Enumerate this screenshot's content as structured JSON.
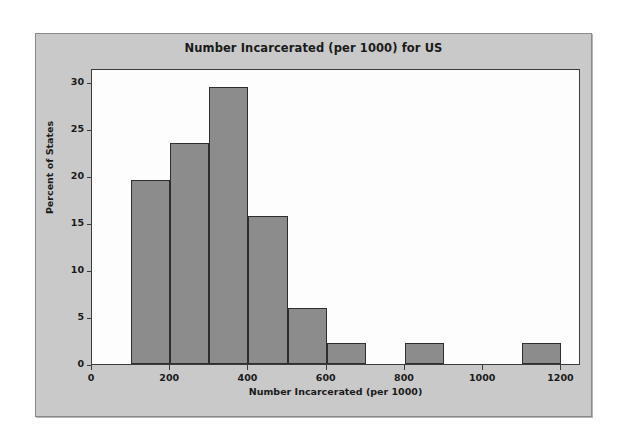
{
  "figure": {
    "background_color": "#c9c9c9",
    "plot_background_color": "#fdfdfd",
    "bar_fill_color": "#8c8c8c",
    "bar_edge_color": "#2e2e2e"
  },
  "chart_data": {
    "type": "bar",
    "title": "Number Incarcerated (per 1000) for US",
    "xlabel": "Number Incarcerated (per 1000)",
    "ylabel": "Percent of States",
    "grid": false,
    "legend": null,
    "xlim": [
      0,
      1250
    ],
    "ylim": [
      0,
      31.5
    ],
    "xticks": [
      0,
      200,
      400,
      600,
      800,
      1000,
      1200
    ],
    "xtick_labels": [
      "0",
      "200",
      "400",
      "600",
      "800",
      "1000",
      "1200"
    ],
    "yticks": [
      0,
      5,
      10,
      15,
      20,
      25,
      30
    ],
    "ytick_labels": [
      "0",
      "5",
      "10",
      "15",
      "20",
      "25",
      "30"
    ],
    "bin_width": 100,
    "bins": [
      {
        "left": 100,
        "right": 200,
        "value": 19.6
      },
      {
        "left": 200,
        "right": 300,
        "value": 23.5
      },
      {
        "left": 300,
        "right": 400,
        "value": 29.5
      },
      {
        "left": 400,
        "right": 500,
        "value": 15.8
      },
      {
        "left": 500,
        "right": 600,
        "value": 6.0
      },
      {
        "left": 600,
        "right": 700,
        "value": 2.2
      },
      {
        "left": 800,
        "right": 900,
        "value": 2.2
      },
      {
        "left": 1100,
        "right": 1200,
        "value": 2.2
      }
    ]
  }
}
